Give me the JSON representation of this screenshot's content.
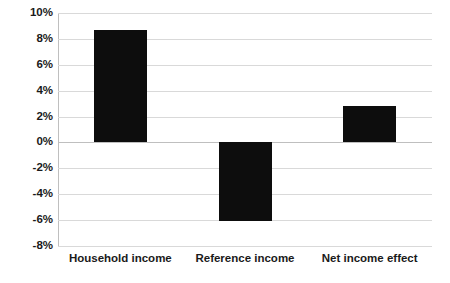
{
  "chart_data": {
    "type": "bar",
    "title": "",
    "subtitle": "",
    "xlabel": "",
    "ylabel": "",
    "categories": [
      "Household income",
      "Reference income",
      "Net income effect"
    ],
    "values": [
      8.7,
      -6.1,
      2.8
    ],
    "value_labels": [
      "8.7%",
      "-6.1%",
      "2.8%"
    ],
    "series": [
      {
        "name": "",
        "values": [
          8.7,
          -6.1,
          2.8
        ]
      }
    ],
    "ylim": [
      -8,
      10
    ],
    "ytick_values": [
      10,
      8,
      6,
      4,
      2,
      0,
      -2,
      -4,
      -6,
      -8
    ],
    "ytick_labels": [
      "10%",
      "8%",
      "6%",
      "4%",
      "2%",
      "0%",
      "-2%",
      "-4%",
      "-6%",
      "-8%"
    ],
    "grid": true,
    "grid_axis": "y",
    "legend": false,
    "legend_position": "none",
    "annotations": [],
    "unit": "percent",
    "bar_color": "#0d0d0d",
    "gridline_color": "#d9d9d9",
    "axis_color": "#bfbfbf",
    "background_color": "#ffffff",
    "text_color": "#1a1a1a"
  }
}
